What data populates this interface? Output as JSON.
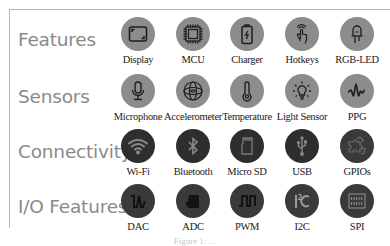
{
  "rows": [
    {
      "title": "Features",
      "circle_color": "#8c8c8c",
      "items": [
        {
          "label": "Display",
          "icon": "display-icon"
        },
        {
          "label": "MCU",
          "icon": "chip-icon"
        },
        {
          "label": "Charger",
          "icon": "battery-charging-icon"
        },
        {
          "label": "Hotkeys",
          "icon": "touch-hand-icon"
        },
        {
          "label": "RGB-LED",
          "icon": "led-icon"
        }
      ]
    },
    {
      "title": "Sensors",
      "circle_color": "#8c8c8c",
      "items": [
        {
          "label": "Microphone",
          "icon": "microphone-icon"
        },
        {
          "label": "Accelerometer",
          "icon": "gyroscope-icon"
        },
        {
          "label": "Temperature",
          "icon": "thermometer-icon"
        },
        {
          "label": "Light Sensor",
          "icon": "light-bulb-icon"
        },
        {
          "label": "PPG",
          "icon": "waveform-icon"
        }
      ]
    },
    {
      "title": "Connectivity",
      "circle_color": "#2e2e2e",
      "items": [
        {
          "label": "Wi-Fi",
          "icon": "wifi-icon"
        },
        {
          "label": "Bluetooth",
          "icon": "bluetooth-icon"
        },
        {
          "label": "Micro SD",
          "icon": "sd-card-icon"
        },
        {
          "label": "USB",
          "icon": "usb-icon"
        },
        {
          "label": "GPIOs",
          "icon": "puzzle-icon"
        }
      ]
    },
    {
      "title": "I/O Features",
      "circle_color": "#3a3a3a",
      "items": [
        {
          "label": "DAC",
          "icon": "dac-wave-icon"
        },
        {
          "label": "ADC",
          "icon": "adc-wave-icon"
        },
        {
          "label": "PWM",
          "icon": "square-wave-icon"
        },
        {
          "label": "I2C",
          "icon": "i2c-icon"
        },
        {
          "label": "SPI",
          "icon": "spi-icon"
        }
      ]
    }
  ],
  "caption": "Figure 1: ..."
}
